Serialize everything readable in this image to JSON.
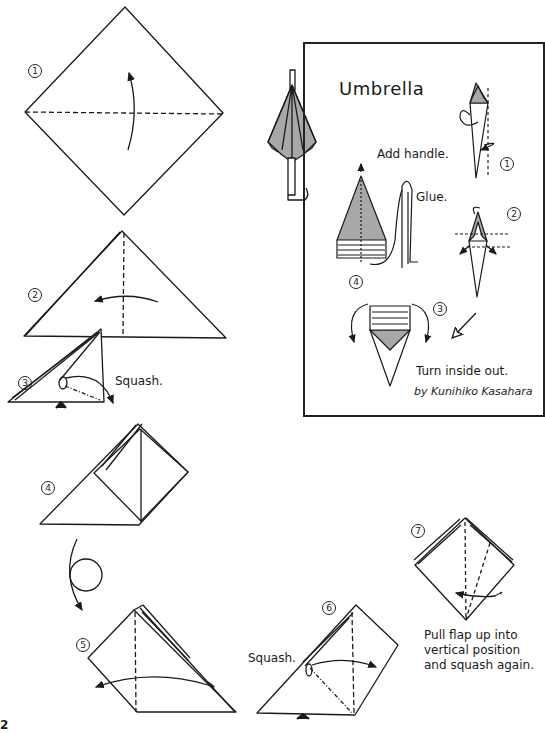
{
  "page_number": "2",
  "panel": {
    "title": "Umbrella",
    "author": "by Kunihiko Kasahara",
    "instructions": {
      "add_handle": "Add handle.",
      "glue": "Glue.",
      "turn_inside_out": "Turn inside out."
    },
    "step_markers": [
      "1",
      "2",
      "3",
      "4"
    ]
  },
  "main_steps": [
    {
      "number": "1",
      "caption": ""
    },
    {
      "number": "2",
      "caption": ""
    },
    {
      "number": "3",
      "caption": "Squash."
    },
    {
      "number": "4",
      "caption": ""
    },
    {
      "number": "5",
      "caption": ""
    },
    {
      "number": "6",
      "caption": "Squash."
    },
    {
      "number": "7",
      "caption": "Pull flap up into vertical position and squash again."
    }
  ],
  "captions": {
    "step7_line1": "Pull flap up into",
    "step7_line2": "vertical position",
    "step7_line3": "and squash again."
  },
  "colors": {
    "line": "#1a1a1a",
    "shade": "#a8a8a8",
    "background": "#ffffff"
  }
}
